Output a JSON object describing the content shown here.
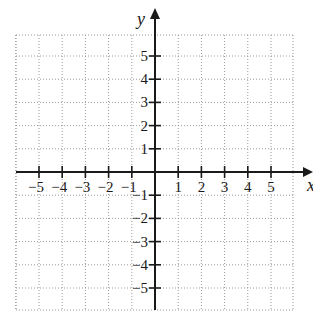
{
  "chart_data": {
    "type": "scatter",
    "title": "",
    "xlabel": "x",
    "ylabel": "y",
    "xlim": [
      -6,
      6
    ],
    "ylim": [
      -6,
      6
    ],
    "grid": true,
    "grid_style": "dotted",
    "x_ticks": [
      -5,
      -4,
      -3,
      -2,
      -1,
      1,
      2,
      3,
      4,
      5
    ],
    "y_ticks": [
      -5,
      -4,
      -3,
      -2,
      -1,
      1,
      2,
      3,
      4,
      5
    ],
    "x_tick_labels": [
      "−5",
      "−4",
      "−3",
      "−2",
      "−1",
      "1",
      "2",
      "3",
      "4",
      "5"
    ],
    "y_tick_labels": [
      "−5",
      "−4",
      "−3",
      "−2",
      "−1",
      "1",
      "2",
      "3",
      "4",
      "5"
    ],
    "series": [],
    "legend": null
  },
  "axes": {
    "x_label": "x",
    "y_label": "y"
  },
  "colors": {
    "axis": "#1a1a1a",
    "grid": "#9a9a9a",
    "background": "#ffffff"
  }
}
